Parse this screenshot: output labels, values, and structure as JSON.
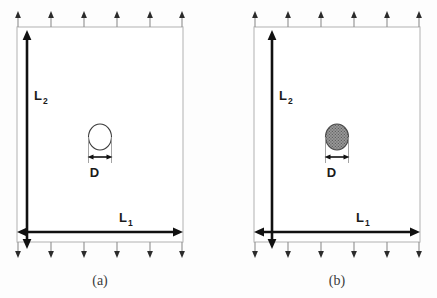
{
  "figure": {
    "type": "schematic-diagram",
    "background_color": "#fdfdfd",
    "panels": [
      {
        "id": "a",
        "caption": "(a)",
        "inclusion_style": "open",
        "inclusion_label": "D",
        "inclusion_fill_color": "#ffffff",
        "inclusion_stroke_color": "#3a3a3a",
        "width_label": "L",
        "width_subscript": "1",
        "height_label": "L",
        "height_subscript": "2",
        "top_arrow_count": 6,
        "bottom_arrow_count": 6,
        "arrow_color": "#8f8f8f",
        "dimension_color": "#111111",
        "domain_stroke_color": "#b9b9b9"
      },
      {
        "id": "b",
        "caption": "(b)",
        "inclusion_style": "filled-dotted",
        "inclusion_label": "D",
        "inclusion_fill_color": "#808080",
        "inclusion_stroke_color": "#4a4a4a",
        "width_label": "L",
        "width_subscript": "1",
        "height_label": "L",
        "height_subscript": "2",
        "top_arrow_count": 6,
        "bottom_arrow_count": 6,
        "arrow_color": "#8f8f8f",
        "dimension_color": "#111111",
        "domain_stroke_color": "#b9b9b9"
      }
    ]
  }
}
